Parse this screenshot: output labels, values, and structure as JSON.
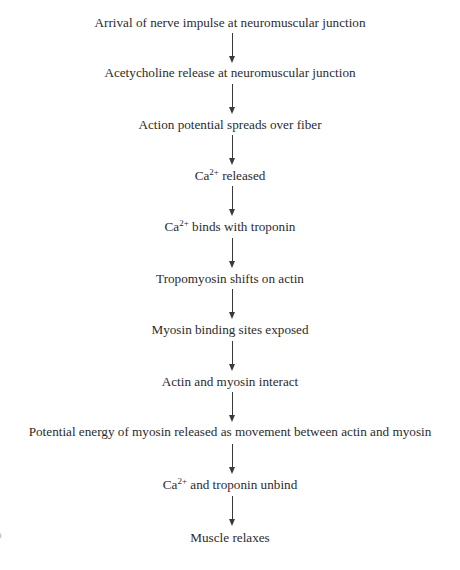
{
  "diagram": {
    "type": "flowchart",
    "direction": "top-to-bottom",
    "steps": [
      {
        "text": "Arrival of nerve impulse at neuromuscular junction"
      },
      {
        "text": "Acetycholine release at neuromuscular junction"
      },
      {
        "text": "Action potential spreads over fiber"
      },
      {
        "prefix": "Ca",
        "sup": "2+",
        "text": " released"
      },
      {
        "prefix": "Ca",
        "sup": "2+",
        "text": " binds with troponin"
      },
      {
        "text": "Tropomyosin shifts on actin"
      },
      {
        "text": "Myosin binding sites exposed"
      },
      {
        "text": "Actin and myosin interact"
      },
      {
        "text": "Potential energy of myosin released as movement between actin and myosin"
      },
      {
        "prefix": "Ca",
        "sup": "2+",
        "text": " and troponin unbind"
      },
      {
        "text": "Muscle relaxes"
      }
    ],
    "arrow_color": "#3a3a3a",
    "text_color": "#2b2b2b"
  },
  "page_mark": "5"
}
